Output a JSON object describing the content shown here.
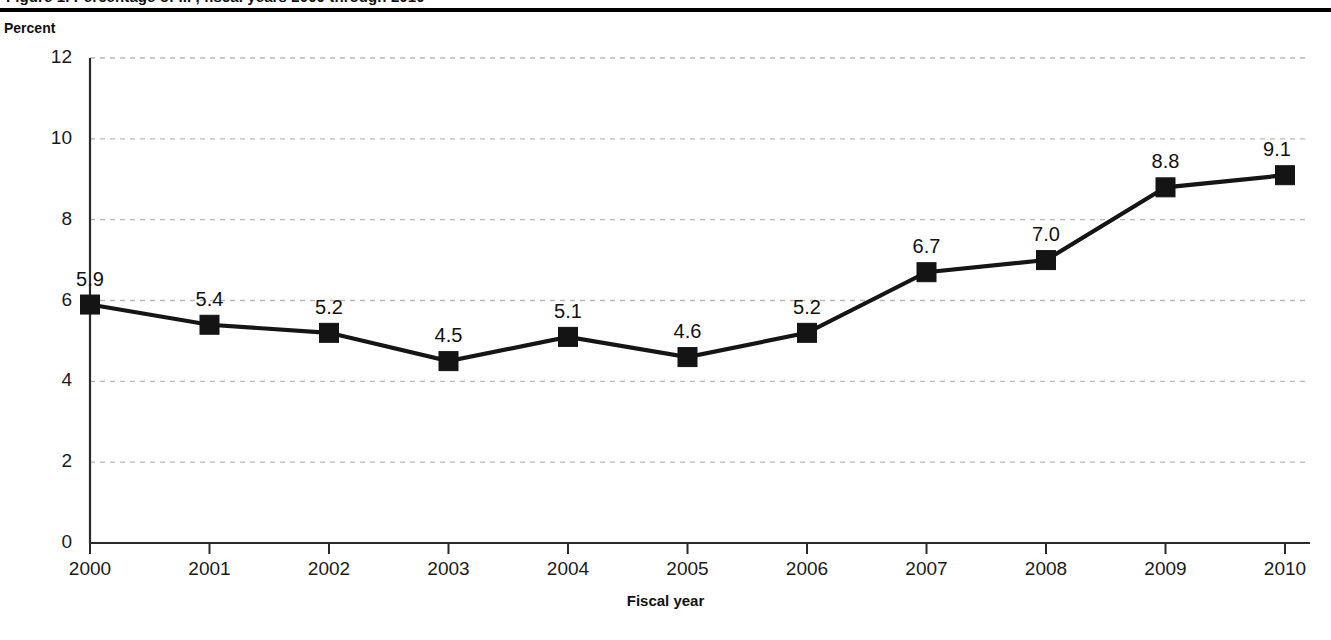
{
  "header": {
    "clipped_caption": "Figure 1. Percentage of ... , fiscal years 2000 through 2010"
  },
  "axes": {
    "y_title": "Percent",
    "x_title": "Fiscal year"
  },
  "chart_data": {
    "type": "line",
    "title": "",
    "xlabel": "Fiscal year",
    "ylabel": "Percent",
    "categories": [
      "2000",
      "2001",
      "2002",
      "2003",
      "2004",
      "2005",
      "2006",
      "2007",
      "2008",
      "2009",
      "2010"
    ],
    "values": [
      5.9,
      5.4,
      5.2,
      4.5,
      5.1,
      4.6,
      5.2,
      6.7,
      7.0,
      8.8,
      9.1
    ],
    "point_labels": [
      "5.9",
      "5.4",
      "5.2",
      "4.5",
      "5.1",
      "4.6",
      "5.2",
      "6.7",
      "7.0",
      "8.8",
      "9.1"
    ],
    "ylim": [
      0,
      12
    ],
    "yticks": [
      0,
      2,
      4,
      6,
      8,
      10,
      12
    ],
    "ytick_labels": [
      "0",
      "2",
      "4",
      "6",
      "8",
      "10",
      "12"
    ],
    "grid": true,
    "grid_axis": "y",
    "legend": "none",
    "marker": "square",
    "series_color": "#141414",
    "grid_color": "#b9b9b9",
    "axis_color": "#2b2b2b"
  }
}
